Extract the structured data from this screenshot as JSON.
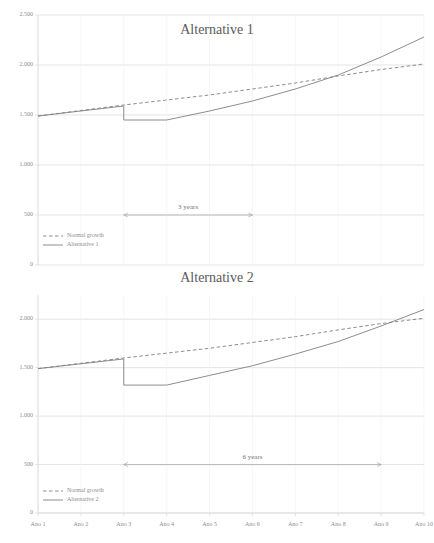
{
  "page": {
    "top_cut_text": "` ` ` ` `",
    "background_color": "#ffffff",
    "text_color": "#595959",
    "grid_color": "#d9d9d9",
    "line_color": "#7f7f7f"
  },
  "x_axis": {
    "categories": [
      "Ano 1",
      "Ano 2",
      "Ano 3",
      "Ano 4",
      "Ano 5",
      "Ano 6",
      "Ano 7",
      "Ano 8",
      "Ano 9",
      "Ano 10"
    ]
  },
  "chart_data": [
    {
      "id": "alternative-1",
      "type": "line",
      "title": "Alternative 1",
      "xlabel": "",
      "ylabel": "",
      "categories": [
        "Ano 1",
        "Ano 2",
        "Ano 3",
        "Ano 4",
        "Ano 5",
        "Ano 6",
        "Ano 7",
        "Ano 8",
        "Ano 9",
        "Ano 10"
      ],
      "ylim": [
        0,
        2500
      ],
      "yticks": [
        0,
        500,
        1000,
        1500,
        2000,
        2500
      ],
      "ytick_labels": [
        "0",
        "500",
        "1.000",
        "1.500",
        "2.000",
        "2.500"
      ],
      "grid": true,
      "legend_position": "bottom-left",
      "series": [
        {
          "name": "Normal growth",
          "style": "dashed",
          "color": "#808080",
          "values": [
            1490,
            1545,
            1600,
            1650,
            1700,
            1760,
            1820,
            1890,
            1955,
            2010
          ]
        },
        {
          "name": "Alternative 1",
          "style": "solid",
          "color": "#808080",
          "values": [
            1490,
            1540,
            1590,
            1450,
            1540,
            1640,
            1760,
            1900,
            2080,
            2280
          ],
          "drop_at_category": "Ano 3",
          "drop_from": 1590,
          "drop_to": 1450
        }
      ],
      "annotations": [
        {
          "label": "3 years",
          "type": "double-arrow",
          "from_category": "Ano 3",
          "to_category": "Ano 6",
          "y_value": 500
        }
      ]
    },
    {
      "id": "alternative-2",
      "type": "line",
      "title": "Alternative 2",
      "xlabel": "",
      "ylabel": "",
      "categories": [
        "Ano 1",
        "Ano 2",
        "Ano 3",
        "Ano 4",
        "Ano 5",
        "Ano 6",
        "Ano 7",
        "Ano 8",
        "Ano 9",
        "Ano 10"
      ],
      "ylim": [
        0,
        2250
      ],
      "yticks": [
        0,
        500,
        1000,
        1500,
        2000
      ],
      "ytick_labels": [
        "0",
        "500",
        "1.000",
        "1.500",
        "2.000"
      ],
      "grid": true,
      "legend_position": "bottom-left",
      "series": [
        {
          "name": "Normal growth",
          "style": "dashed",
          "color": "#808080",
          "values": [
            1490,
            1545,
            1600,
            1650,
            1700,
            1760,
            1820,
            1890,
            1955,
            2010
          ]
        },
        {
          "name": "Alternative 2",
          "style": "solid",
          "color": "#808080",
          "values": [
            1490,
            1540,
            1590,
            1320,
            1420,
            1520,
            1640,
            1770,
            1930,
            2100
          ],
          "drop_at_category": "Ano 3",
          "drop_from": 1590,
          "drop_to": 1320
        }
      ],
      "annotations": [
        {
          "label": "6 years",
          "type": "double-arrow",
          "from_category": "Ano 3",
          "to_category": "Ano 9",
          "y_value": 500
        }
      ]
    }
  ]
}
